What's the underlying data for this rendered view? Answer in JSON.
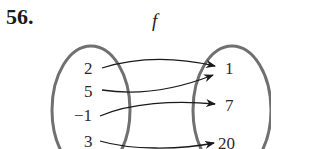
{
  "problem_number": "56.",
  "function_name": "f",
  "domain_set": [
    "2",
    "5",
    "−1",
    "3"
  ],
  "range_set": [
    "1",
    "7",
    "20"
  ],
  "mappings": [
    {
      "from": "2",
      "to": "1"
    },
    {
      "from": "5",
      "to": "1"
    },
    {
      "from": "−1",
      "to": "7"
    },
    {
      "from": "3",
      "to": "20"
    }
  ],
  "colors": {
    "oval": "#707070",
    "arrow": "#1a1a1a",
    "text": "#2a2a2a"
  }
}
